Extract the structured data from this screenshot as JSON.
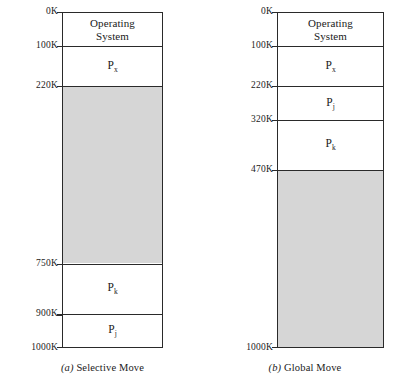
{
  "figure": {
    "type": "memory-allocation-diagram",
    "address_min": 0,
    "address_max": 1000,
    "address_unit": "K",
    "free_fill_color": "#d6d6d6",
    "line_color": "#2a2a2a"
  },
  "panels": [
    {
      "id": "selective-move",
      "caption_index": "(a)",
      "caption_text": "Selective Move",
      "caption_full": "(a) Selective Move",
      "addresses": [
        "0K",
        "100K",
        "220K",
        "750K",
        "900K",
        "1000K"
      ],
      "regions": [
        {
          "name": "operating-system",
          "label": "Operating\nSystem",
          "base": "P",
          "sub": "",
          "start": 0,
          "end": 100,
          "free": false
        },
        {
          "name": "process-px",
          "label": "P",
          "base": "P",
          "sub": "x",
          "start": 100,
          "end": 220,
          "free": false
        },
        {
          "name": "free-space",
          "label": "",
          "base": "",
          "sub": "",
          "start": 220,
          "end": 750,
          "free": true
        },
        {
          "name": "process-pk",
          "label": "P",
          "base": "P",
          "sub": "k",
          "start": 750,
          "end": 900,
          "free": false
        },
        {
          "name": "process-pj",
          "label": "P",
          "base": "P",
          "sub": "j",
          "start": 900,
          "end": 1000,
          "free": false
        }
      ]
    },
    {
      "id": "global-move",
      "caption_index": "(b)",
      "caption_text": "Global Move",
      "caption_full": "(b) Global Move",
      "addresses": [
        "0K",
        "100K",
        "220K",
        "320K",
        "470K",
        "1000K"
      ],
      "regions": [
        {
          "name": "operating-system",
          "label": "Operating\nSystem",
          "base": "P",
          "sub": "",
          "start": 0,
          "end": 100,
          "free": false
        },
        {
          "name": "process-px",
          "label": "P",
          "base": "P",
          "sub": "x",
          "start": 100,
          "end": 220,
          "free": false
        },
        {
          "name": "process-pj",
          "label": "P",
          "base": "P",
          "sub": "j",
          "start": 220,
          "end": 320,
          "free": false
        },
        {
          "name": "process-pk",
          "label": "P",
          "base": "P",
          "sub": "k",
          "start": 320,
          "end": 470,
          "free": false
        },
        {
          "name": "free-space",
          "label": "",
          "base": "",
          "sub": "",
          "start": 470,
          "end": 1000,
          "free": true
        }
      ]
    }
  ]
}
